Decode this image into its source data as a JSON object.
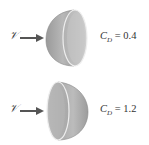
{
  "figure": {
    "flow_symbol": "𝒱",
    "cases": [
      {
        "orientation": "convex-side-facing-flow",
        "cd_symbol": "C",
        "cd_subscript": "D",
        "cd_equals": " = ",
        "cd_value": "0.4"
      },
      {
        "orientation": "concave-side-facing-flow",
        "cd_symbol": "C",
        "cd_subscript": "D",
        "cd_equals": " = ",
        "cd_value": "1.2"
      }
    ],
    "colors": {
      "shell_outer": "#a8a8a8",
      "shell_inner": "#c8c8c8",
      "arrow": "#555555",
      "text": "#333333"
    }
  }
}
